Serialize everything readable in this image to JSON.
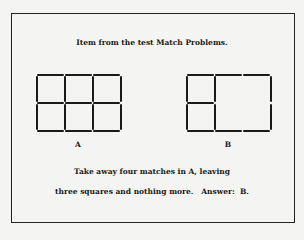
{
  "title": "Item from the test Match Problems.",
  "figures": [
    {
      "label": "A",
      "description": "2x3 grid of six squares made of 17 matches"
    },
    {
      "label": "B",
      "description": "Three squares: two small stacked squares on left and one large 2x2 square on right"
    }
  ],
  "instructions": {
    "line1": "Take away four matches in A, leaving",
    "line2": "three squares and nothing more.   Answer:  B."
  },
  "colors": {
    "ink": "#1a1a1a",
    "paper": "#f4f4f2"
  }
}
